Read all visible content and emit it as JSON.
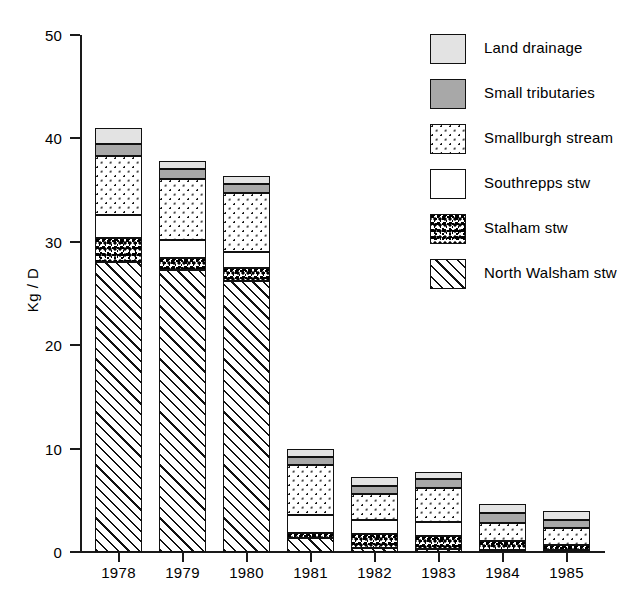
{
  "chart_data": {
    "type": "bar",
    "stacked": true,
    "title": "",
    "xlabel": "",
    "ylabel": "Kg / D",
    "ylim": [
      0,
      50
    ],
    "ytick_labels": [
      "0",
      "10",
      "20",
      "30",
      "40",
      "50"
    ],
    "ytick_values": [
      0,
      10,
      20,
      30,
      40,
      50
    ],
    "grid": false,
    "legend_position": "top-right",
    "categories": [
      "1978",
      "1979",
      "1980",
      "1981",
      "1982",
      "1983",
      "1984",
      "1985"
    ],
    "series": [
      {
        "name": "North Walsham stw",
        "pattern": "diagonal-hatch",
        "color": "#ffffff",
        "values": [
          28.0,
          27.3,
          26.2,
          1.4,
          0.4,
          0.3,
          0.2,
          0.2
        ]
      },
      {
        "name": "Stalham stw",
        "pattern": "mottled-speckle",
        "color": "#000000",
        "values": [
          2.4,
          1.1,
          1.3,
          0.4,
          1.3,
          1.2,
          0.9,
          0.5
        ]
      },
      {
        "name": "Southrepps stw",
        "pattern": "solid-white",
        "color": "#ffffff",
        "values": [
          2.2,
          1.8,
          1.5,
          1.8,
          1.4,
          1.4,
          0.0,
          0.0
        ]
      },
      {
        "name": "Smallburgh stream",
        "pattern": "dotted",
        "color": "#ffffff",
        "values": [
          5.7,
          5.9,
          5.7,
          4.8,
          2.5,
          3.3,
          1.7,
          1.6
        ]
      },
      {
        "name": "Small tributaries",
        "pattern": "solid-gray",
        "color": "#a8a8a8",
        "values": [
          1.2,
          0.9,
          0.9,
          0.8,
          0.8,
          0.9,
          1.0,
          0.8
        ]
      },
      {
        "name": "Land drainage",
        "pattern": "solid-light-gray",
        "color": "#e3e3e3",
        "values": [
          1.5,
          0.8,
          0.8,
          0.8,
          0.9,
          0.6,
          0.8,
          0.9
        ]
      }
    ],
    "totals": [
      41.0,
      37.8,
      36.4,
      10.0,
      7.3,
      7.7,
      4.6,
      4.0
    ]
  },
  "legend": {
    "items": [
      {
        "label": "Land drainage",
        "swatch": "solid-light-gray"
      },
      {
        "label": "Small tributaries",
        "swatch": "solid-gray"
      },
      {
        "label": "Smallburgh stream",
        "swatch": "dotted"
      },
      {
        "label": "Southrepps stw",
        "swatch": "solid-white"
      },
      {
        "label": "Stalham stw",
        "swatch": "mottled-speckle"
      },
      {
        "label": "North Walsham stw",
        "swatch": "diagonal-hatch"
      }
    ]
  },
  "axes": {
    "y_title": "Kg / D",
    "y_labels": [
      "50",
      "40",
      "30",
      "20",
      "10",
      "0"
    ],
    "x_labels": [
      "1978",
      "1979",
      "1980",
      "1981",
      "1982",
      "1983",
      "1984",
      "1985"
    ]
  }
}
